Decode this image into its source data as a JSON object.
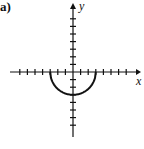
{
  "panel_label": "a)",
  "chart_data": {
    "type": "line",
    "title": "",
    "xlabel": "x",
    "ylabel": "y",
    "xlim": [
      -8,
      8
    ],
    "ylim": [
      -8,
      8
    ],
    "grid": false,
    "series": [
      {
        "name": "lower semicircle",
        "x": [
          -3,
          -2.5,
          -2,
          -1.5,
          -1,
          -0.5,
          0,
          0.5,
          1,
          1.5,
          2,
          2.5,
          3
        ],
        "y": [
          0,
          -1.66,
          -2.24,
          -2.6,
          -2.83,
          -2.96,
          -3,
          -2.96,
          -2.83,
          -2.6,
          -2.24,
          -1.66,
          0
        ]
      }
    ],
    "x_ticks": [
      -7,
      -6,
      -5,
      -4,
      -3,
      -2,
      -1,
      1,
      2,
      3,
      4,
      5,
      6,
      7
    ],
    "y_ticks": [
      -7,
      -6,
      -5,
      -4,
      -3,
      -2,
      -1,
      1,
      2,
      3,
      4,
      5,
      6,
      7
    ]
  }
}
